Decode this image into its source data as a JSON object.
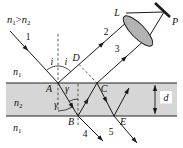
{
  "diagram": {
    "condition": {
      "n_a": "n",
      "sub_a": "1",
      "op": ">",
      "n_b": "n",
      "sub_b": "2"
    },
    "media": {
      "top_sym": "n",
      "top_sub": "1",
      "mid_sym": "n",
      "mid_sub": "2",
      "bot_sym": "n",
      "bot_sub": "1"
    },
    "rays": {
      "r1": "1",
      "r2": "2",
      "r3": "3",
      "r4": "4",
      "r5": "5"
    },
    "points": {
      "a": "A",
      "b": "B",
      "c": "C",
      "d_pt": "D",
      "e": "E"
    },
    "angles": {
      "i_left": "i",
      "i_right": "i",
      "gamma_upper": "γ",
      "gamma_lower": "γ"
    },
    "optics": {
      "lens": "L",
      "focus": "P",
      "thickness": "d"
    }
  }
}
